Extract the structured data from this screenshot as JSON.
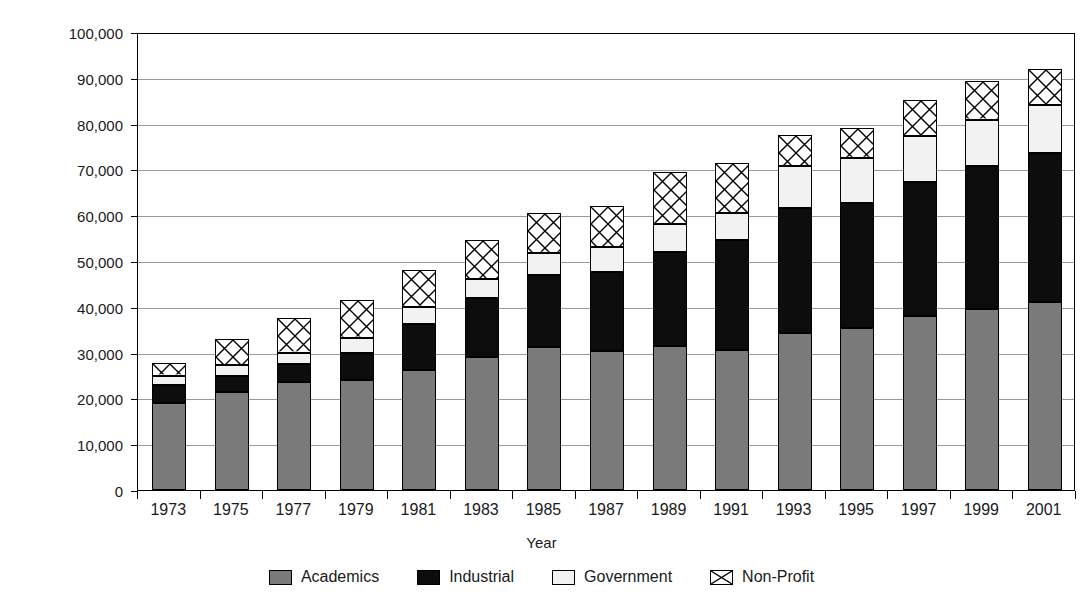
{
  "chart_data": {
    "type": "bar",
    "subtype": "stacked-bar",
    "title": "",
    "xlabel": "Year",
    "ylabel": "Number",
    "ylim": [
      0,
      100000
    ],
    "ytick_step": 10000,
    "ytick_labels": [
      "100,000",
      "90,000",
      "80,000",
      "70,000",
      "60,000",
      "50,000",
      "40,000",
      "30,000",
      "20,000",
      "10,000",
      "0"
    ],
    "ytick_values": [
      100000,
      90000,
      80000,
      70000,
      60000,
      50000,
      40000,
      30000,
      20000,
      10000,
      0
    ],
    "grid": true,
    "legend_position": "bottom",
    "categories": [
      "1973",
      "1975",
      "1977",
      "1979",
      "1981",
      "1983",
      "1985",
      "1987",
      "1989",
      "1991",
      "1993",
      "1995",
      "1997",
      "1999",
      "2001"
    ],
    "series": [
      {
        "name": "Academics",
        "color": "#7a7a7a",
        "pattern": "solid-gray",
        "values": [
          19000,
          21500,
          23500,
          24000,
          26200,
          29000,
          31300,
          30300,
          31500,
          30500,
          34300,
          35300,
          38000,
          39500,
          41000
        ]
      },
      {
        "name": "Industrial",
        "color": "#0d0d0d",
        "pattern": "solid-black",
        "values": [
          4000,
          3500,
          4100,
          6000,
          10000,
          13000,
          15700,
          17200,
          20500,
          24000,
          27200,
          27300,
          29200,
          31300,
          32500
        ]
      },
      {
        "name": "Government",
        "color": "#f2f2f2",
        "pattern": "solid-white",
        "values": [
          2000,
          2200,
          2400,
          3300,
          3800,
          4000,
          4800,
          5500,
          6000,
          6000,
          9200,
          10000,
          10000,
          10000,
          10500
        ]
      },
      {
        "name": "Non-Profit",
        "color": "#ffffff",
        "pattern": "cross-hatch",
        "values": [
          2700,
          5800,
          7500,
          8200,
          8000,
          8500,
          8700,
          9000,
          11500,
          11000,
          6800,
          6500,
          8000,
          8400,
          8000
        ]
      }
    ],
    "totals": [
      27700,
      33000,
      37500,
      41500,
      48000,
      54500,
      60500,
      63500,
      69500,
      71500,
      77500,
      79100,
      85200,
      89200,
      92000
    ]
  },
  "legend": {
    "items": [
      {
        "label": "Academics",
        "swatch": "swatch-academics-icon"
      },
      {
        "label": "Industrial",
        "swatch": "swatch-industrial-icon"
      },
      {
        "label": "Government",
        "swatch": "swatch-government-icon"
      },
      {
        "label": "Non-Profit",
        "swatch": "swatch-nonprofit-icon"
      }
    ]
  }
}
